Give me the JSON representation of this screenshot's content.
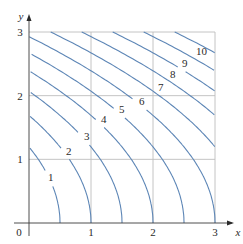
{
  "chart_data": {
    "type": "line",
    "subtype": "contour",
    "title": "",
    "xlabel": "x",
    "ylabel": "y",
    "xlim": [
      0,
      3
    ],
    "ylim": [
      0,
      3
    ],
    "x_ticks": [
      "0",
      "1",
      "2",
      "3"
    ],
    "y_ticks": [
      "1",
      "2",
      "3"
    ],
    "origin_label": "0",
    "grid": true,
    "legend": "none",
    "contour_levels": [
      1,
      2,
      3,
      4,
      5,
      6,
      7,
      8,
      9,
      10,
      11
    ],
    "labeled_levels": [
      "1",
      "2",
      "3",
      "4",
      "5",
      "6",
      "7",
      "8",
      "9",
      "10"
    ],
    "approx_function": "f(x,y) ≈ 2x + 0.7y²",
    "x_intercepts": [
      0.5,
      1.0,
      1.5,
      2.0,
      2.5,
      3.0
    ],
    "y_intercepts_approx": [
      1.2,
      1.7,
      2.1,
      2.45,
      2.7,
      2.93
    ],
    "label_positions_px": [
      {
        "text": "1",
        "x": 48,
        "y": 181
      },
      {
        "text": "2",
        "x": 66,
        "y": 155
      },
      {
        "text": "3",
        "x": 84,
        "y": 140
      },
      {
        "text": "4",
        "x": 101,
        "y": 123
      },
      {
        "text": "5",
        "x": 119,
        "y": 113
      },
      {
        "text": "6",
        "x": 139,
        "y": 105
      },
      {
        "text": "7",
        "x": 158,
        "y": 91
      },
      {
        "text": "8",
        "x": 170,
        "y": 78
      },
      {
        "text": "9",
        "x": 182,
        "y": 67
      },
      {
        "text": "10",
        "x": 196,
        "y": 55
      }
    ]
  },
  "colors": {
    "contour": "#5d86b6",
    "grid": "#bdbdbd",
    "axis": "#3a3a3a"
  },
  "layout": {
    "x0": 29,
    "y0": 223,
    "x3": 215,
    "y3": 32
  }
}
